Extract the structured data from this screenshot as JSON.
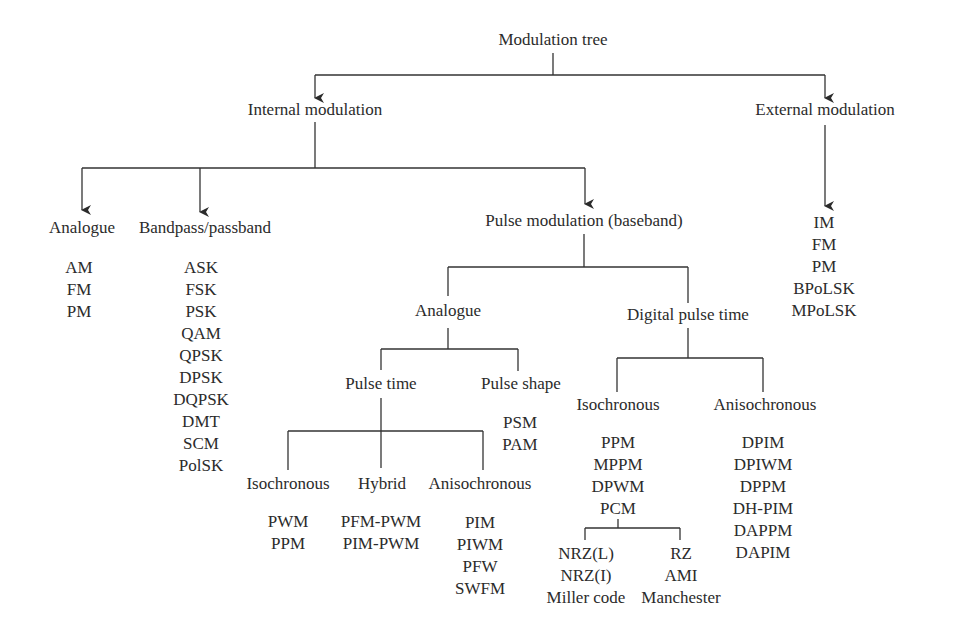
{
  "title": "Modulation tree",
  "internal": {
    "label": "Internal modulation",
    "analogue": {
      "label": "Analogue",
      "items": [
        "AM",
        "FM",
        "PM"
      ]
    },
    "bandpass": {
      "label": "Bandpass/passband",
      "items": [
        "ASK",
        "FSK",
        "PSK",
        "QAM",
        "QPSK",
        "DPSK",
        "DQPSK",
        "DMT",
        "SCM",
        "PolSK"
      ]
    },
    "pulse": {
      "label": "Pulse modulation (baseband)",
      "analogue": {
        "label": "Analogue",
        "pulse_time": {
          "label": "Pulse time",
          "isochronous": {
            "label": "Isochronous",
            "items": [
              "PWM",
              "PPM"
            ]
          },
          "hybrid": {
            "label": "Hybrid",
            "items": [
              "PFM-PWM",
              "PIM-PWM"
            ]
          },
          "anisochronous": {
            "label": "Anisochronous",
            "items": [
              "PIM",
              "PIWM",
              "PFW",
              "SWFM"
            ]
          }
        },
        "pulse_shape": {
          "label": "Pulse shape",
          "items": [
            "PSM",
            "PAM"
          ]
        }
      },
      "digital": {
        "label": "Digital pulse time",
        "isochronous": {
          "label": "Isochronous",
          "items": [
            "PPM",
            "MPPM",
            "DPWM",
            "PCM"
          ],
          "pcm_nrz": [
            "NRZ(L)",
            "NRZ(I)",
            "Miller code"
          ],
          "pcm_rz": [
            "RZ",
            "AMI",
            "Manchester"
          ]
        },
        "anisochronous": {
          "label": "Anisochronous",
          "items": [
            "DPIM",
            "DPIWM",
            "DPPM",
            "DH-PIM",
            "DAPPM",
            "DAPIM"
          ]
        }
      }
    }
  },
  "external": {
    "label": "External modulation",
    "items": [
      "IM",
      "FM",
      "PM",
      "BPoLSK",
      "MPoLSK"
    ]
  },
  "colors": {
    "line": "#333333",
    "text": "#2b2b2b"
  }
}
